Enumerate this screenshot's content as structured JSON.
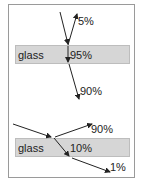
{
  "diagram": {
    "title": "",
    "top_case": {
      "medium_label": "glass",
      "reflected_label": "5%",
      "transmitted_in_glass_label": "95%",
      "exit_label": "90%"
    },
    "bottom_case": {
      "medium_label": "glass",
      "reflected_label": "90%",
      "transmitted_in_glass_label": "10%",
      "exit_label": "1%"
    },
    "colors": {
      "glass_fill": "#d6d6d6",
      "ray": "#222222",
      "frame": "#9a9a9a"
    }
  }
}
